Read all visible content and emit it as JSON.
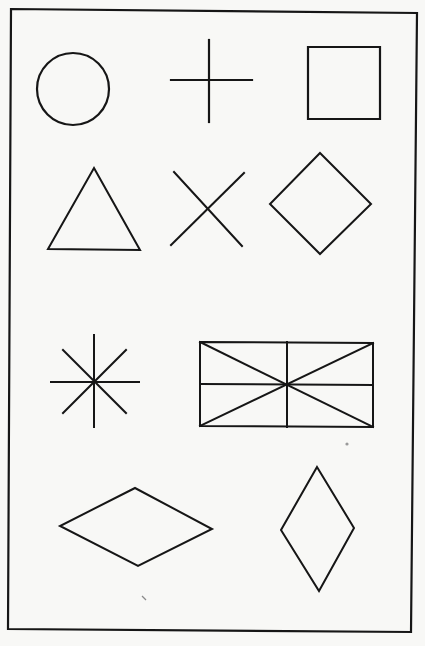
{
  "figure": {
    "description": "Geometric shapes copying figure",
    "background": "#f8f8f6",
    "ink": "#161616",
    "frame": {
      "points": [
        [
          11,
          9
        ],
        [
          417,
          13
        ],
        [
          411,
          632
        ],
        [
          8,
          629
        ]
      ],
      "stroke_width": 2.2
    },
    "shapes": [
      {
        "id": "circle",
        "label": "circle",
        "type": "circle",
        "cx": 73,
        "cy": 89,
        "r": 36,
        "stroke_width": 2.2
      },
      {
        "id": "plus",
        "label": "plus sign (cross)",
        "type": "lines",
        "lines": [
          [
            [
              209,
              40
            ],
            [
              209,
              122
            ]
          ],
          [
            [
              171,
              80
            ],
            [
              252,
              80
            ]
          ]
        ],
        "stroke_width": 2.2
      },
      {
        "id": "square",
        "label": "square",
        "type": "polygon",
        "points": [
          [
            308,
            47
          ],
          [
            380,
            47
          ],
          [
            380,
            119
          ],
          [
            308,
            119
          ]
        ],
        "stroke_width": 2.2
      },
      {
        "id": "triangle",
        "label": "triangle",
        "type": "polygon",
        "points": [
          [
            94,
            168
          ],
          [
            140,
            250
          ],
          [
            48,
            249
          ]
        ],
        "stroke_width": 2
      },
      {
        "id": "x-cross",
        "label": "diagonal cross (X)",
        "type": "lines",
        "lines": [
          [
            [
              174,
              172
            ],
            [
              242,
              246
            ]
          ],
          [
            [
              244,
              173
            ],
            [
              171,
              245
            ]
          ]
        ],
        "stroke_width": 2
      },
      {
        "id": "diamond",
        "label": "diamond (rotated square)",
        "type": "polygon",
        "points": [
          [
            320,
            153
          ],
          [
            371,
            204
          ],
          [
            320,
            254
          ],
          [
            270,
            204
          ]
        ],
        "stroke_width": 2
      },
      {
        "id": "asterisk",
        "label": "eight-point star (asterisk)",
        "type": "lines",
        "lines": [
          [
            [
              94,
              335
            ],
            [
              94,
              427
            ]
          ],
          [
            [
              51,
              382
            ],
            [
              139,
              382
            ]
          ],
          [
            [
              63,
              350
            ],
            [
              126,
              413
            ]
          ],
          [
            [
              126,
              350
            ],
            [
              63,
              413
            ]
          ]
        ],
        "stroke_width": 2
      },
      {
        "id": "divided-rectangle",
        "label": "rectangle with cross and diagonals",
        "type": "compound",
        "polygon": [
          [
            200,
            342
          ],
          [
            373,
            343
          ],
          [
            373,
            427
          ],
          [
            200,
            426
          ]
        ],
        "lines": [
          [
            [
              287,
              342
            ],
            [
              287,
              427
            ]
          ],
          [
            [
              200,
              384
            ],
            [
              373,
              385
            ]
          ],
          [
            [
              200,
              342
            ],
            [
              373,
              427
            ]
          ],
          [
            [
              373,
              343
            ],
            [
              200,
              426
            ]
          ]
        ],
        "stroke_width": 2
      },
      {
        "id": "horizontal-rhombus",
        "label": "horizontal rhombus",
        "type": "polygon",
        "points": [
          [
            135,
            488
          ],
          [
            212,
            529
          ],
          [
            138,
            566
          ],
          [
            60,
            526
          ]
        ],
        "stroke_width": 2
      },
      {
        "id": "vertical-rhombus",
        "label": "vertical rhombus",
        "type": "polygon",
        "points": [
          [
            317,
            467
          ],
          [
            354,
            528
          ],
          [
            319,
            591
          ],
          [
            281,
            530
          ]
        ],
        "stroke_width": 2
      }
    ],
    "artifacts": [
      {
        "id": "scan-dot",
        "type": "dot",
        "cx": 347,
        "cy": 444,
        "r": 1.6,
        "color": "#9a9a9a"
      },
      {
        "id": "scan-mark",
        "type": "line",
        "from": [
          142,
          596
        ],
        "to": [
          146,
          600
        ],
        "color": "#8a8a8a",
        "stroke_width": 1.2
      }
    ]
  }
}
